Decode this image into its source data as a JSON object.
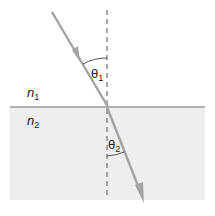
{
  "diagram": {
    "labels": {
      "theta1": "θ",
      "theta1_sub": "1",
      "theta2": "θ",
      "theta2_sub": "2",
      "n1": "n",
      "n1_sub": "1",
      "n2": "n",
      "n2_sub": "2"
    },
    "colors": {
      "ray": "#a3a3a3",
      "interface": "#6b6b6b",
      "normal": "#555555",
      "medium2": "#eeeeee",
      "background": "#ffffff",
      "text": "#222222"
    }
  }
}
